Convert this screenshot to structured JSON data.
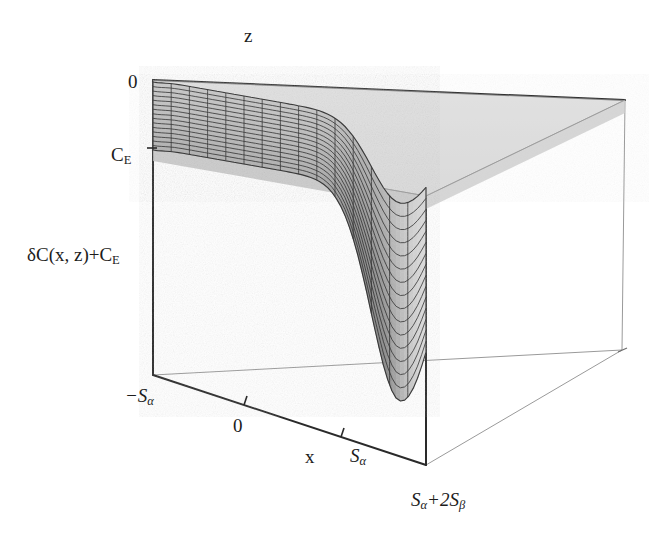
{
  "figure": {
    "kind": "3d-surface-plot",
    "background": "#ffffff",
    "ink": "#1c1c1c",
    "mesh_line_color": "#2b2b2b",
    "surface_fill_light": "#e8e8e8",
    "surface_fill_mid": "#cfcfcf",
    "surface_fill_dark": "#9a9a9a",
    "frame_color": "#3a3a3a",
    "frame_thin_color": "#8e8e8e"
  },
  "axes": {
    "z_axis": {
      "label": "z",
      "ticks": [
        {
          "label": "0",
          "value": 0
        }
      ]
    },
    "vertical_axis": {
      "label_parts": {
        "prefix": "δC(x, z)+C",
        "subscript": "E"
      },
      "label_plain": "δC(x, z)+C_E",
      "ticks": [
        {
          "label_parts": {
            "prefix": "C",
            "subscript": "E"
          },
          "label_plain": "C_E"
        }
      ]
    },
    "x_axis": {
      "label": "x",
      "ticks": [
        {
          "label_parts": {
            "prefix": "−S",
            "subscript": "α"
          },
          "label_plain": "-S_alpha",
          "value": -1
        },
        {
          "label_parts": {
            "prefix": "0"
          },
          "label_plain": "0",
          "value": 0
        },
        {
          "label_parts": {
            "prefix": "S",
            "subscript": "α"
          },
          "label_plain": "S_alpha",
          "value": 1
        }
      ]
    },
    "depth_axis": {
      "ticks": [
        {
          "label_parts": {
            "prefix": "S",
            "subscript": "α",
            "middle": "+2S",
            "subscript2": "β"
          },
          "label_plain": "S_alpha+2S_beta"
        }
      ]
    }
  },
  "chart_data": {
    "type": "surface",
    "title": "",
    "xlabel": "x",
    "ylabel": "z",
    "zlabel": "δC(x, z)+C_E",
    "grid": true,
    "legend": false,
    "legend_position": "none",
    "x": {
      "min": -1.0,
      "max": 1.45,
      "tick_values": [
        -1.0,
        0.0,
        1.0
      ],
      "tick_labels": [
        "-S_alpha",
        "0",
        "S_alpha"
      ]
    },
    "z": {
      "min": 0.0,
      "max": 1.0,
      "tick_values": [
        0.0
      ],
      "tick_labels": [
        "0"
      ]
    },
    "value": {
      "top_plateau": 1.0,
      "plane_level": 1.0,
      "trough_min": -2.6,
      "units": "C_E"
    },
    "mesh": {
      "nx": 15,
      "nz": 15
    },
    "surface_samples": {
      "note": "value at height above base for x across domain at the front edge (z=0); 1.0 = C_E plateau",
      "x_values": [
        -1.0,
        -0.85,
        -0.7,
        -0.55,
        -0.4,
        -0.25,
        -0.1,
        0.05,
        0.2,
        0.35,
        0.5,
        0.65,
        0.8,
        0.95,
        1.0,
        1.08,
        1.15,
        1.25,
        1.35,
        1.45
      ],
      "front_values": [
        0.98,
        0.99,
        1.0,
        1.0,
        1.0,
        1.0,
        1.0,
        1.0,
        1.0,
        0.99,
        0.96,
        0.88,
        0.62,
        0.05,
        -0.4,
        -1.45,
        -2.2,
        -2.6,
        -2.3,
        -0.6
      ],
      "back_values": [
        0.99,
        1.0,
        1.0,
        1.0,
        1.0,
        1.0,
        1.0,
        1.0,
        1.0,
        1.0,
        0.99,
        0.95,
        0.8,
        0.4,
        0.1,
        -0.55,
        -1.05,
        -1.4,
        -1.1,
        0.1
      ]
    }
  },
  "geometry": {
    "box_corners_px": {
      "back_left_top": [
        153,
        80
      ],
      "back_right_top": [
        625,
        100
      ],
      "front_left_top": [
        153,
        148
      ],
      "front_right_top": [
        426,
        196
      ],
      "back_left_bottom": [
        153,
        375
      ],
      "front_left_bottom": [
        153,
        375
      ],
      "front_bottom": [
        426,
        465
      ],
      "right_bottom": [
        622,
        350
      ]
    }
  }
}
